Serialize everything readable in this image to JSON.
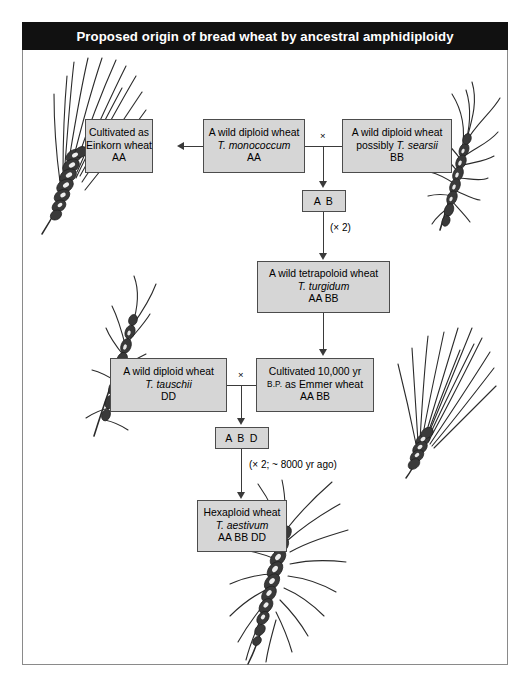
{
  "title": "Proposed origin of bread wheat by ancestral amphidiploidy",
  "colors": {
    "banner_bg": "#111111",
    "banner_text": "#ffffff",
    "box_fill": "#d6d6d6",
    "box_border": "#4c4c4c",
    "frame_border": "#8a8a8a",
    "connector": "#3a3a3a",
    "wheat_ink": "#2b2b2b"
  },
  "boxes": {
    "einkorn": {
      "line1": "Cultivated as",
      "line2": "Einkorn wheat",
      "line3": "AA"
    },
    "monococcum": {
      "line1": "A wild diploid wheat",
      "line2": "T. monococcum",
      "line3": "AA"
    },
    "searsii": {
      "line1": "A wild diploid wheat",
      "line2a": "possibly ",
      "line2b": "T. searsii",
      "line3": "BB"
    },
    "turgidum": {
      "line1": "A wild tetrapoloid wheat",
      "line2": "T. turgidum",
      "line3": "AA BB"
    },
    "tauschii": {
      "line1": "A wild diploid wheat",
      "line2": "T. tauschii",
      "line3": "DD"
    },
    "emmer": {
      "line1": "Cultivated 10,000 yr",
      "line2a": "B.P.",
      "line2b": " as Emmer wheat",
      "line3": "AA BB"
    },
    "aestivum": {
      "line1": "Hexaploid wheat",
      "line2": "T. aestivum",
      "line3": "AA BB DD"
    }
  },
  "genomes": {
    "ab": "A B",
    "abd": "A B D"
  },
  "notes": {
    "doubling_1": "(× 2)",
    "doubling_2": "(× 2; ~ 8000 yr ago)",
    "cross_1": "×",
    "cross_2": "×"
  },
  "illustrations": [
    {
      "name": "einkorn-wheat-spike",
      "caption_for": "einkorn"
    },
    {
      "name": "searsii-wheat-spike",
      "caption_for": "searsii"
    },
    {
      "name": "tauschii-wheat-spike",
      "caption_for": "tauschii"
    },
    {
      "name": "emmer-wheat-spike",
      "caption_for": "emmer"
    },
    {
      "name": "aestivum-wheat-spike",
      "caption_for": "aestivum"
    }
  ]
}
